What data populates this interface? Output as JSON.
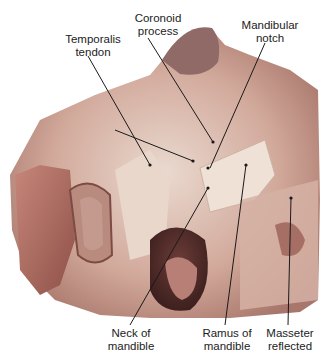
{
  "figure": {
    "colors": {
      "tissue_light": "#e8d3c8",
      "tissue_mid": "#c99a8c",
      "tissue_dark": "#8a5a52",
      "muscle": "#b8665e",
      "bone": "#efe4d8",
      "leader_line": "#1a1a1a"
    },
    "labels": [
      {
        "id": "coronoid-process",
        "text": "Coronoid\nprocess"
      },
      {
        "id": "mandibular-notch",
        "text": "Mandibular\nnotch"
      },
      {
        "id": "temporalis-tendon",
        "text": "Temporalis\ntendon"
      },
      {
        "id": "neck-of-mandible",
        "text": "Neck of\nmandible"
      },
      {
        "id": "ramus-of-mandible",
        "text": "Ramus of\nmandible"
      },
      {
        "id": "masseter-reflected",
        "text": "Masseter\nreflected"
      }
    ]
  }
}
